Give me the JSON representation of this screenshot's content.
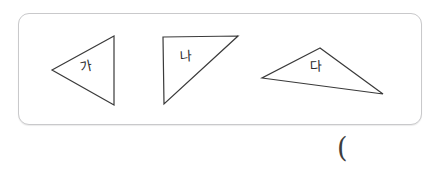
{
  "figure": {
    "panel": {
      "name": "shape-panel",
      "border_color": "#c9c9cb",
      "background": "#ffffff"
    },
    "stroke_color": "#3a3a3a",
    "shapes": [
      {
        "id": "triangle-ga",
        "label": "가",
        "kind": "triangle",
        "orientation": "left-pointing",
        "points": "52,70 114,36 114,105",
        "label_x": 80,
        "label_y": 60,
        "label_rotation_deg": -12
      },
      {
        "id": "triangle-na",
        "label": "나",
        "kind": "right-triangle",
        "orientation": "top-right hypotenuse",
        "points": "163,37 238,36 164,104",
        "label_x": 180,
        "label_y": 50,
        "label_rotation_deg": -3
      },
      {
        "id": "triangle-da",
        "label": "다",
        "kind": "triangle",
        "orientation": "obtuse wide",
        "points": "320,48 262,78 383,94",
        "label_x": 310,
        "label_y": 60,
        "label_rotation_deg": -2
      }
    ],
    "annotation": {
      "paren": "(",
      "x": 337,
      "y": 134
    }
  }
}
